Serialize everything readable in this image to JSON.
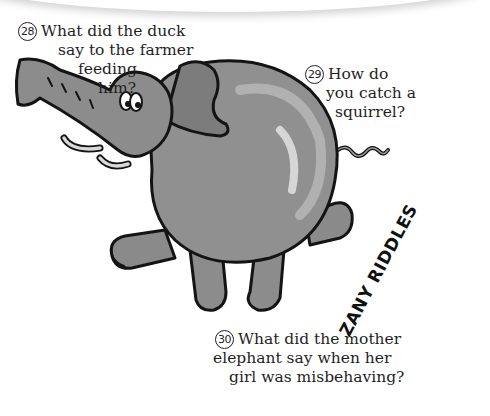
{
  "page": {
    "background": "#ffffff",
    "illustration": {
      "subject": "flying-elephant-cartoon",
      "fill_colors": [
        "#8c8c8c",
        "#6e6e6e",
        "#a8a8a8",
        "#c8c8c8"
      ],
      "outline_color": "#141414"
    }
  },
  "riddles": [
    {
      "number": "28",
      "lines": [
        "What did the duck",
        "say to the farmer",
        "feeding",
        "him?"
      ]
    },
    {
      "number": "29",
      "lines": [
        "How do",
        "you catch a",
        "squirrel?"
      ]
    },
    {
      "number": "30",
      "lines": [
        "What did the mother",
        "elephant say when her",
        "girl was misbehaving?"
      ]
    }
  ],
  "brand": {
    "title": "ZANY RIDDLES"
  }
}
